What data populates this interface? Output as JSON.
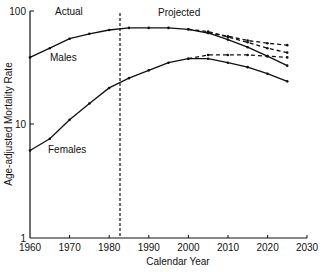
{
  "chart_data": {
    "type": "line",
    "title": "",
    "xlabel": "Calendar Year",
    "ylabel": "Age-adjusted Mortality Rate",
    "yscale": "log",
    "xlim": [
      1960,
      2030
    ],
    "ylim": [
      1,
      100
    ],
    "xticks": [
      1960,
      1970,
      1980,
      1990,
      2000,
      2010,
      2020,
      2030
    ],
    "yticks": [
      1,
      10,
      100
    ],
    "divider": {
      "x": 1983,
      "left_label": "Actual",
      "right_label": "Projected"
    },
    "series": [
      {
        "name": "Males",
        "style": "solid",
        "x": [
          1960,
          1965,
          1970,
          1975,
          1980,
          1985,
          1990,
          1995,
          2000,
          2005,
          2010,
          2015,
          2020,
          2025
        ],
        "values": [
          39,
          47,
          57,
          63,
          68,
          71,
          71,
          71,
          69,
          64,
          56,
          48,
          40,
          33
        ]
      },
      {
        "name": "Males (projected alt)",
        "style": "dashed",
        "x": [
          2000,
          2005,
          2010,
          2015,
          2020,
          2025
        ],
        "values": [
          69,
          66,
          59,
          53,
          47,
          43
        ]
      },
      {
        "name": "Males (projected alt 2)",
        "style": "dashed",
        "x": [
          2005,
          2010,
          2015,
          2020,
          2025
        ],
        "values": [
          64,
          60,
          55,
          52,
          50
        ]
      },
      {
        "name": "Females",
        "style": "solid",
        "x": [
          1960,
          1965,
          1970,
          1975,
          1980,
          1985,
          1990,
          1995,
          2000,
          2005,
          2010,
          2015,
          2020,
          2025
        ],
        "values": [
          5.9,
          7.5,
          11,
          15.3,
          21,
          25.6,
          30,
          35,
          38,
          38,
          35,
          32,
          28,
          24
        ]
      },
      {
        "name": "Females (projected alt)",
        "style": "dashed",
        "x": [
          2000,
          2005,
          2010,
          2015,
          2020,
          2025
        ],
        "values": [
          38,
          41,
          41,
          41,
          40,
          39
        ]
      }
    ],
    "annotations": [
      "Males",
      "Females",
      "Actual",
      "Projected"
    ]
  },
  "labels": {
    "actual": "Actual",
    "projected": "Projected",
    "males": "Males",
    "females": "Females",
    "xlabel": "Calendar Year",
    "ylabel": "Age-adjusted Mortality Rate",
    "y100": "100",
    "y10": "10",
    "y1": "1",
    "x1960": "1960",
    "x1970": "1970",
    "x1980": "1980",
    "x1990": "1990",
    "x2000": "2000",
    "x2010": "2010",
    "x2020": "2020",
    "x2030": "2030"
  }
}
